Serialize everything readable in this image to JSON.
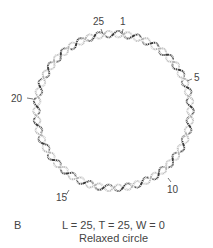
{
  "figure": {
    "panel_label": "B",
    "caption_line1": "L = 25, T = 25, W = 0",
    "caption_line2": "Relaxed circle",
    "markers": [
      {
        "label": "25",
        "angle_deg": -98
      },
      {
        "label": "1",
        "angle_deg": -80
      },
      {
        "label": "5",
        "angle_deg": -22
      },
      {
        "label": "10",
        "angle_deg": 45
      },
      {
        "label": "15",
        "angle_deg": 118
      },
      {
        "label": "20",
        "angle_deg": 190
      }
    ],
    "helix_turns": 25,
    "colors": {
      "strand_dark": "#3a3a3a",
      "strand_light": "#b5b5b5",
      "text": "#444444"
    }
  }
}
